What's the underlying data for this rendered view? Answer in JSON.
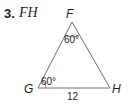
{
  "problem": {
    "number": "3.",
    "target": "FH"
  },
  "triangle": {
    "vertices": {
      "top": "F",
      "left": "G",
      "right": "H"
    },
    "angles": {
      "F": "60°",
      "G": "60°"
    },
    "sides": {
      "GH": "12"
    }
  }
}
